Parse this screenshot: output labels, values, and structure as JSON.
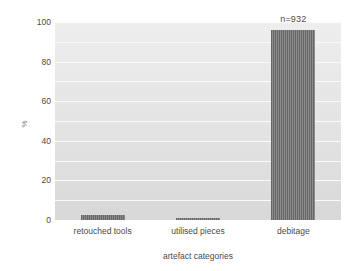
{
  "chart_data": {
    "type": "bar",
    "title": "",
    "subtitle": "",
    "xlabel": "artefact categories",
    "ylabel": "%",
    "categories": [
      "retouched tools",
      "utilised pieces",
      "debitage"
    ],
    "values": [
      2.7,
      1.2,
      96.1
    ],
    "ylim": [
      0,
      100
    ],
    "yticks": [
      0,
      20,
      40,
      60,
      80,
      100
    ],
    "ytick_labels": [
      "0",
      "20",
      "40",
      "60",
      "80",
      "100"
    ],
    "minor_gridlines": [
      10,
      30,
      50,
      70,
      90
    ],
    "grid": true,
    "legend": false,
    "annotations": [
      {
        "text": "n=932",
        "category": "debitage",
        "position": "above-bar"
      }
    ],
    "series": [
      {
        "name": "percentage of assemblage",
        "values": [
          2.7,
          1.2,
          96.1
        ]
      }
    ],
    "colors": {
      "bar_fill": "#6e6e6e",
      "bar_hatch_dark": "#666666",
      "bar_hatch_light": "#8c8c8c",
      "plot_background": "#e6e6e6",
      "gridline": "#fbfbfb",
      "text": "#4a4a4a",
      "page_background": "#ffffff"
    }
  }
}
